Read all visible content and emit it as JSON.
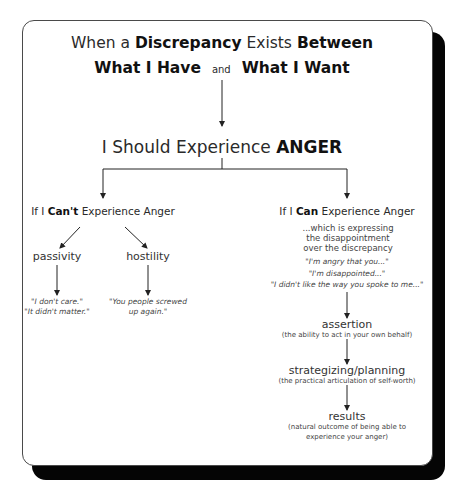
{
  "header": {
    "line1": [
      {
        "text": "When a ",
        "bold": false
      },
      {
        "text": "Discrepancy",
        "bold": true
      },
      {
        "text": " Exists ",
        "bold": false
      },
      {
        "text": "Between",
        "bold": true
      }
    ],
    "line2": {
      "left": "What I Have",
      "connector": "and",
      "right": "What I Want"
    }
  },
  "central": {
    "prefix": "I Should Experience ",
    "emphasis": "ANGER"
  },
  "left_branch": {
    "prefix": "If I ",
    "emphasis": "Can't",
    "suffix": " Experience Anger",
    "children": [
      {
        "label": "passivity",
        "quotes": [
          "\"I don't care.\"",
          "\"It didn't matter.\""
        ]
      },
      {
        "label": "hostility",
        "quotes": [
          "\"You people screwed",
          "up again.\""
        ]
      }
    ]
  },
  "right_branch": {
    "prefix": "If I ",
    "emphasis": "Can",
    "suffix": " Experience Anger",
    "description": [
      "...which is expressing",
      "the disappointment",
      "over the discrepancy"
    ],
    "quotes": [
      "\"I'm angry that you...\"",
      "\"I'm disappointed...\"",
      "\"I didn't like the way you spoke to me...\""
    ],
    "steps": [
      {
        "label": "assertion",
        "note": [
          "(the ability to act in your own behalf)"
        ]
      },
      {
        "label": "strategizing/planning",
        "note": [
          "(the practical articulation of self-worth)"
        ]
      },
      {
        "label": "results",
        "note": [
          "(natural outcome of being able to",
          "experience your anger)"
        ]
      }
    ]
  },
  "colors": {
    "card_background": "#ffffff",
    "shadow": "#050505",
    "text": "#2a2a2a",
    "lines": "#222222"
  }
}
